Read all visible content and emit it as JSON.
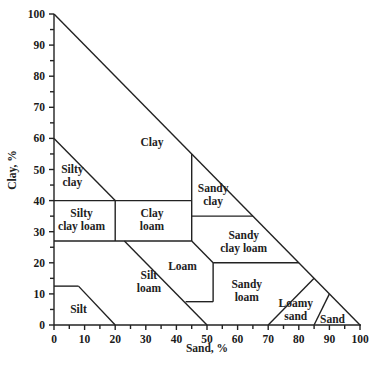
{
  "chart_data": {
    "type": "diagram",
    "xlabel": "Sand, %",
    "ylabel": "Clay, %",
    "xlim": [
      0,
      100
    ],
    "ylim": [
      0,
      100
    ],
    "x_ticks": [
      "0",
      "10",
      "20",
      "30",
      "40",
      "50",
      "60",
      "70",
      "80",
      "90",
      "100"
    ],
    "y_ticks": [
      "0",
      "10",
      "20",
      "30",
      "40",
      "50",
      "60",
      "70",
      "80",
      "90",
      "100"
    ],
    "regions": [
      {
        "name": "Clay",
        "lines": [
          "Clay"
        ],
        "x": 32,
        "y": 59
      },
      {
        "name": "Silty clay",
        "lines": [
          "Silty",
          "clay"
        ],
        "x": 6,
        "y": 48
      },
      {
        "name": "Silty clay loam",
        "lines": [
          "Silty",
          "clay loam"
        ],
        "x": 9,
        "y": 34
      },
      {
        "name": "Clay loam",
        "lines": [
          "Clay",
          "loam"
        ],
        "x": 32,
        "y": 34
      },
      {
        "name": "Sandy clay",
        "lines": [
          "Sandy",
          "clay"
        ],
        "x": 52,
        "y": 42
      },
      {
        "name": "Sandy clay loam",
        "lines": [
          "Sandy",
          "clay loam"
        ],
        "x": 62,
        "y": 27
      },
      {
        "name": "Loam",
        "lines": [
          "Loam"
        ],
        "x": 42,
        "y": 19
      },
      {
        "name": "Silt loam",
        "lines": [
          "Silt",
          "loam"
        ],
        "x": 31,
        "y": 14
      },
      {
        "name": "Silt",
        "lines": [
          "Silt"
        ],
        "x": 8,
        "y": 5
      },
      {
        "name": "Sandy loam",
        "lines": [
          "Sandy",
          "loam"
        ],
        "x": 63,
        "y": 11
      },
      {
        "name": "Loamy sand",
        "lines": [
          "Loamy",
          "sand"
        ],
        "x": 79,
        "y": 5
      },
      {
        "name": "Sand",
        "lines": [
          "Sand"
        ],
        "x": 91,
        "y": 2
      }
    ],
    "boundaries": [
      [
        [
          0,
          100
        ],
        [
          100,
          0
        ]
      ],
      [
        [
          0,
          60
        ],
        [
          20,
          40
        ]
      ],
      [
        [
          0,
          40
        ],
        [
          45,
          40
        ]
      ],
      [
        [
          20,
          40
        ],
        [
          20,
          27
        ]
      ],
      [
        [
          0,
          27
        ],
        [
          45,
          27
        ]
      ],
      [
        [
          45,
          55
        ],
        [
          45,
          27
        ]
      ],
      [
        [
          45,
          35
        ],
        [
          65,
          35
        ]
      ],
      [
        [
          45,
          27
        ],
        [
          52,
          20
        ]
      ],
      [
        [
          52,
          20
        ],
        [
          80,
          20
        ]
      ],
      [
        [
          52,
          20
        ],
        [
          52,
          7.5
        ]
      ],
      [
        [
          43,
          7.5
        ],
        [
          52,
          7.5
        ]
      ],
      [
        [
          23,
          27
        ],
        [
          50,
          0
        ]
      ],
      [
        [
          0,
          12.5
        ],
        [
          8,
          12.5
        ]
      ],
      [
        [
          8,
          12.5
        ],
        [
          20,
          0
        ]
      ],
      [
        [
          70,
          0
        ],
        [
          85,
          15
        ]
      ],
      [
        [
          85,
          0
        ],
        [
          90,
          10
        ]
      ]
    ]
  }
}
